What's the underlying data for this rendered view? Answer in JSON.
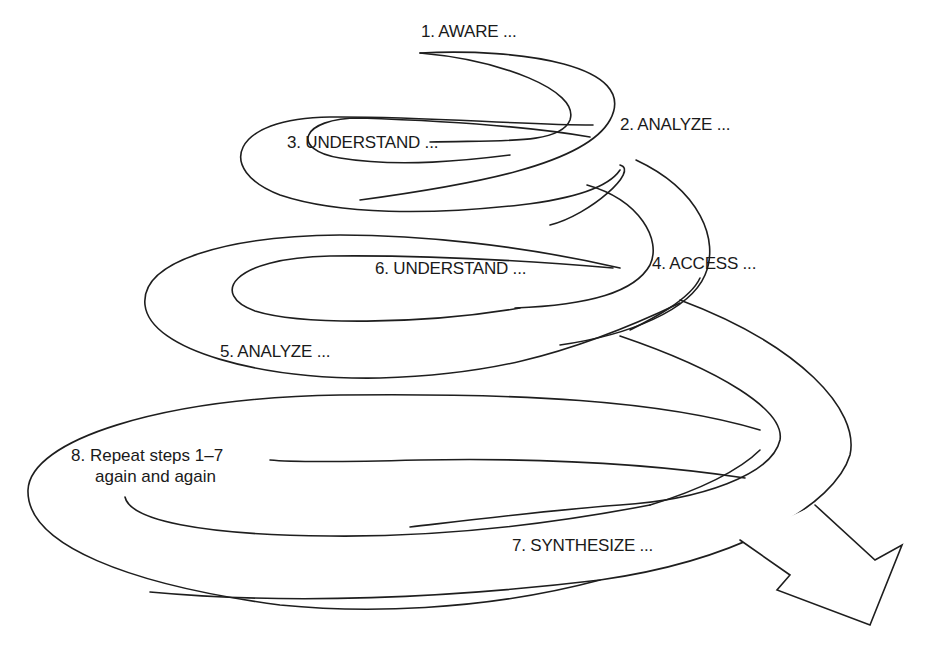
{
  "diagram": {
    "steps": [
      {
        "number": 1,
        "label": "1. AWARE ..."
      },
      {
        "number": 2,
        "label": "2. ANALYZE ..."
      },
      {
        "number": 3,
        "label": "3. UNDERSTAND ..."
      },
      {
        "number": 4,
        "label": "4. ACCESS ..."
      },
      {
        "number": 5,
        "label": "5. ANALYZE ..."
      },
      {
        "number": 6,
        "label": "6. UNDERSTAND ..."
      },
      {
        "number": 7,
        "label": "7. SYNTHESIZE ..."
      },
      {
        "number": 8,
        "label_line1": "8. Repeat steps 1–7",
        "label_line2": "again and again"
      }
    ],
    "colors": {
      "stroke": "#1e1e1e",
      "background": "#ffffff",
      "text": "#1a1a1a"
    },
    "arrow": {
      "direction": "down-right"
    }
  }
}
